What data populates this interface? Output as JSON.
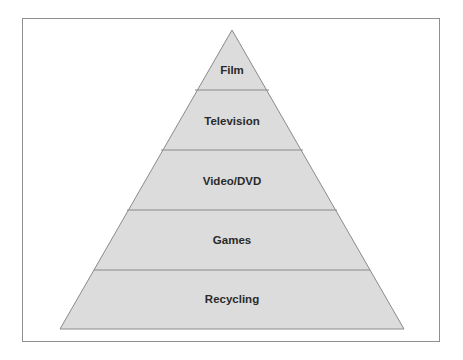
{
  "diagram": {
    "type": "pyramid",
    "fill_color": "#dcdcdc",
    "line_color": "#8a8a8a",
    "levels_top_to_bottom": [
      {
        "label": "Film"
      },
      {
        "label": "Television"
      },
      {
        "label": "Video/DVD"
      },
      {
        "label": "Games"
      },
      {
        "label": "Recycling"
      }
    ]
  }
}
